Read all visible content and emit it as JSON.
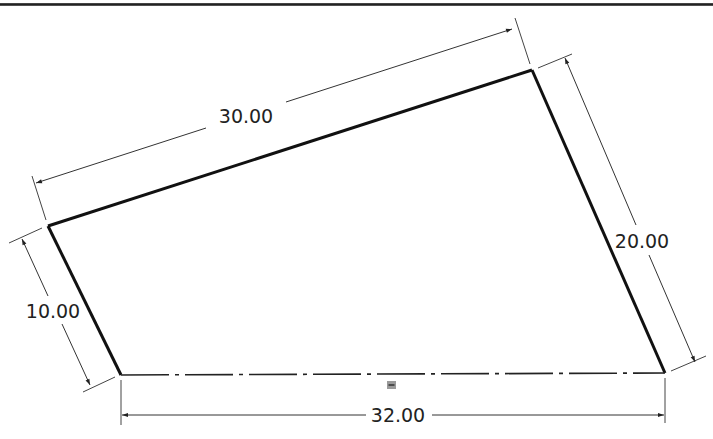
{
  "drawing": {
    "type": "sketch",
    "shape": "quadrilateral",
    "vertices": {
      "top_left": [
        48,
        226
      ],
      "top_right": [
        532,
        70
      ],
      "bottom_right": [
        665,
        373
      ],
      "bottom_left": [
        121,
        375
      ]
    },
    "bottom_edge_style": "centerline (dash-dot)",
    "relation_icon": "horizontal-relation-icon"
  },
  "dimensions": {
    "top": {
      "label": "30.00",
      "value": 30.0
    },
    "right": {
      "label": "20.00",
      "value": 20.0
    },
    "left": {
      "label": "10.00",
      "value": 10.0
    },
    "bottom": {
      "label": "32.00",
      "value": 32.0
    }
  },
  "colors": {
    "outline": "#111111",
    "dimension_line": "#333333",
    "relation_icon": "#8a8a8a",
    "background": "#ffffff"
  }
}
